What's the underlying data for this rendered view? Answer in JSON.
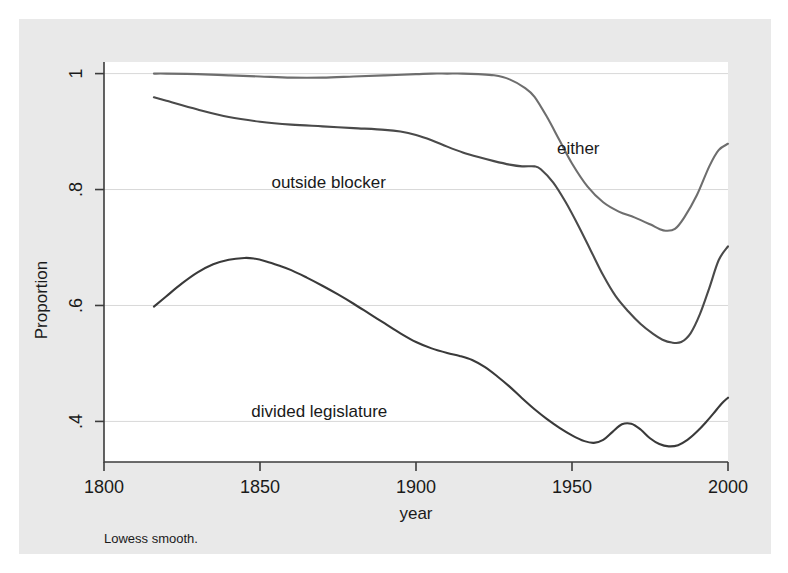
{
  "chart_data": {
    "type": "line",
    "title": "",
    "xlabel": "year",
    "ylabel": "Proportion",
    "note": "Lowess smooth.",
    "xlim": [
      1800,
      2000
    ],
    "ylim": [
      0.33,
      1.02
    ],
    "xticks": [
      1800,
      1850,
      1900,
      1950,
      2000
    ],
    "xtick_labels": [
      "1800",
      "1850",
      "1900",
      "1950",
      "2000"
    ],
    "yticks": [
      0.4,
      0.6,
      0.8,
      1.0
    ],
    "ytick_labels": [
      ".4",
      ".6",
      ".8",
      "1"
    ],
    "grid": true,
    "legend_position": "inline-annotations",
    "series": [
      {
        "name": "either",
        "label": "either",
        "color": "#6e6e6e",
        "label_x": 1952,
        "label_y": 0.862,
        "x": [
          1816,
          1820,
          1830,
          1840,
          1850,
          1860,
          1870,
          1880,
          1890,
          1900,
          1905,
          1910,
          1915,
          1920,
          1925,
          1930,
          1935,
          1938,
          1942,
          1946,
          1950,
          1955,
          1960,
          1965,
          1970,
          1975,
          1978,
          1980,
          1983,
          1986,
          1990,
          1994,
          1997,
          2000
        ],
        "y": [
          1.0,
          1.0,
          0.999,
          0.997,
          0.995,
          0.993,
          0.993,
          0.995,
          0.997,
          0.999,
          1.0,
          1.0,
          1.0,
          0.999,
          0.997,
          0.99,
          0.975,
          0.96,
          0.925,
          0.885,
          0.845,
          0.805,
          0.778,
          0.762,
          0.752,
          0.74,
          0.732,
          0.729,
          0.732,
          0.752,
          0.79,
          0.84,
          0.868,
          0.879
        ]
      },
      {
        "name": "outside blocker",
        "label": "outside blocker",
        "color": "#4a4a4a",
        "label_x": 1872,
        "label_y": 0.802,
        "x": [
          1816,
          1820,
          1830,
          1840,
          1850,
          1860,
          1870,
          1880,
          1890,
          1895,
          1900,
          1905,
          1910,
          1915,
          1920,
          1925,
          1930,
          1934,
          1938,
          1940,
          1944,
          1948,
          1952,
          1956,
          1960,
          1964,
          1968,
          1972,
          1976,
          1979,
          1982,
          1985,
          1988,
          1991,
          1994,
          1997,
          2000
        ],
        "y": [
          0.959,
          0.953,
          0.938,
          0.925,
          0.917,
          0.912,
          0.909,
          0.906,
          0.903,
          0.9,
          0.894,
          0.885,
          0.874,
          0.864,
          0.856,
          0.849,
          0.843,
          0.84,
          0.84,
          0.835,
          0.812,
          0.778,
          0.738,
          0.695,
          0.652,
          0.616,
          0.59,
          0.568,
          0.551,
          0.541,
          0.536,
          0.537,
          0.552,
          0.585,
          0.63,
          0.678,
          0.702
        ]
      },
      {
        "name": "divided legislature",
        "label": "divided legislature",
        "color": "#3a3a3a",
        "label_x": 1869,
        "label_y": 0.408,
        "x": [
          1816,
          1820,
          1825,
          1830,
          1835,
          1840,
          1845,
          1848,
          1852,
          1856,
          1860,
          1865,
          1870,
          1875,
          1880,
          1885,
          1890,
          1895,
          1900,
          1905,
          1910,
          1914,
          1918,
          1922,
          1926,
          1930,
          1934,
          1938,
          1942,
          1946,
          1950,
          1954,
          1957,
          1960,
          1963,
          1966,
          1969,
          1972,
          1975,
          1978,
          1981,
          1984,
          1987,
          1990,
          1993,
          1996,
          1998,
          2000
        ],
        "y": [
          0.598,
          0.616,
          0.638,
          0.657,
          0.671,
          0.679,
          0.682,
          0.681,
          0.676,
          0.669,
          0.661,
          0.648,
          0.634,
          0.619,
          0.603,
          0.586,
          0.569,
          0.552,
          0.537,
          0.526,
          0.518,
          0.513,
          0.506,
          0.494,
          0.478,
          0.46,
          0.44,
          0.421,
          0.404,
          0.389,
          0.376,
          0.366,
          0.363,
          0.368,
          0.382,
          0.395,
          0.396,
          0.386,
          0.371,
          0.361,
          0.357,
          0.359,
          0.368,
          0.382,
          0.399,
          0.418,
          0.431,
          0.441
        ]
      }
    ]
  }
}
